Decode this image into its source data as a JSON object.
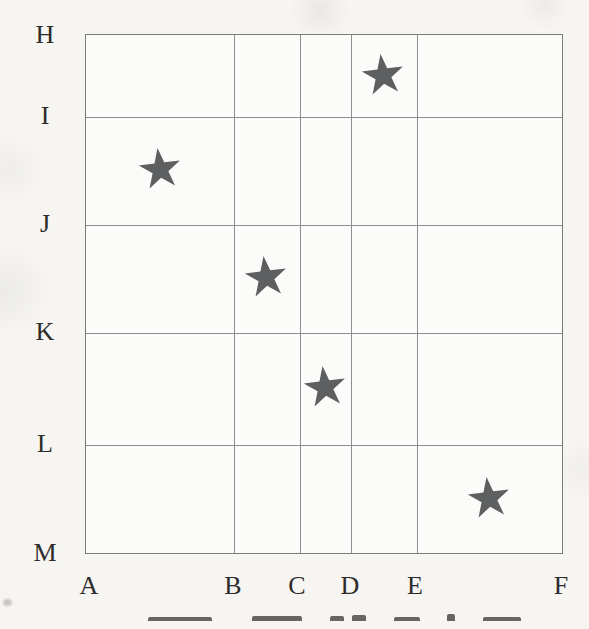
{
  "figure": {
    "row_labels": [
      "H",
      "I",
      "J",
      "K",
      "L",
      "M"
    ],
    "col_labels": [
      "A",
      "B",
      "C",
      "D",
      "E",
      "F"
    ]
  },
  "chart_data": {
    "type": "scatter",
    "title": "",
    "xlabel": "",
    "ylabel": "",
    "x_categories": [
      "A",
      "B",
      "C",
      "D",
      "E",
      "F"
    ],
    "y_categories": [
      "H",
      "I",
      "J",
      "K",
      "L",
      "M"
    ],
    "grid": true,
    "legend": false,
    "marker": "five-pointed-star",
    "marker_glyph": "★",
    "marker_color": "#5d5f60",
    "points": [
      {
        "cell": "D-E x H-I",
        "col_index": 3,
        "row_index": 0
      },
      {
        "cell": "A-B x I-J",
        "col_index": 0,
        "row_index": 1
      },
      {
        "cell": "B-C x J-K",
        "col_index": 1,
        "row_index": 2
      },
      {
        "cell": "C-D x K-L",
        "col_index": 2,
        "row_index": 3
      },
      {
        "cell": "E-F x L-M",
        "col_index": 4,
        "row_index": 4
      }
    ],
    "layout_hint": "irregular category spacing; each star centered in its grid cell"
  },
  "footer": {
    "caption_cropped": true
  },
  "colors": {
    "paper": "#f6f5f2",
    "grid_line": "#8e8e8e",
    "border": "#7b7b7b",
    "label_text": "#2d2c2a",
    "star": "#5d5f60"
  }
}
